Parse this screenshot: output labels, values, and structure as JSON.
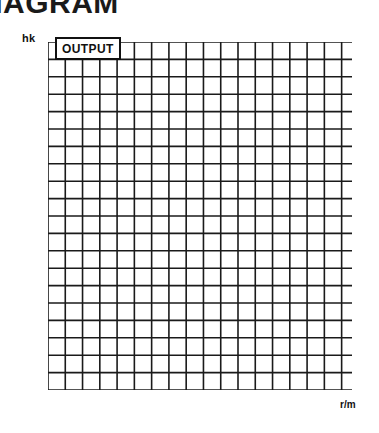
{
  "page": {
    "title_fragment": "AGRAM",
    "full_title_guess": "DIAGRAM"
  },
  "chart_data": {
    "type": "line",
    "title": "AGRAM",
    "annotation_label": "OUTPUT",
    "xlabel": "r/m",
    "ylabel": "hk",
    "xlim": [
      800,
      2560
    ],
    "ylim": [
      5,
      25
    ],
    "grid": true,
    "legend_position": "none",
    "x_ticks": [
      1000,
      1500,
      2000,
      2500
    ],
    "x_tick_labels": [
      "1000",
      "1 500",
      "2000",
      "2500"
    ],
    "y_ticks": [
      5,
      10,
      15,
      20,
      25
    ],
    "y_tick_labels": [
      "5",
      "10",
      "15",
      "20",
      "25"
    ],
    "x_minor_step": 100,
    "y_minor_step": 1,
    "series": [
      {
        "name": "OUTPUT",
        "color": "#111111",
        "x": [
          1000,
          1100,
          1200,
          1300,
          1400,
          1500,
          1600,
          1700,
          1800,
          1900,
          2000,
          2100,
          2200,
          2300,
          2400,
          2480
        ],
        "y": [
          7.0,
          8.3,
          9.4,
          10.3,
          11.3,
          12.5,
          13.9,
          15.3,
          16.8,
          18.3,
          19.7,
          20.9,
          22.0,
          23.0,
          24.0,
          24.7
        ]
      }
    ]
  }
}
